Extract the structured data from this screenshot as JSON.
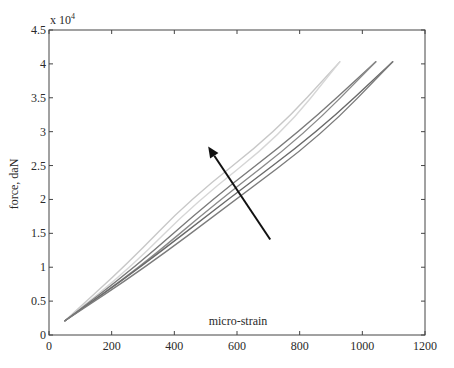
{
  "chart_data": {
    "type": "line",
    "title": "",
    "xlabel": "micro-strain",
    "ylabel": "force, daN",
    "y_multiplier_label": "x 10",
    "y_multiplier_exponent": "4",
    "xlim": [
      0,
      1200
    ],
    "ylim": [
      0,
      4.5
    ],
    "x_ticks": [
      0,
      200,
      400,
      600,
      800,
      1000,
      1200
    ],
    "y_ticks": [
      0,
      0.5,
      1,
      1.5,
      2,
      2.5,
      3,
      3.5,
      4,
      4.5
    ],
    "x_tick_labels": [
      "0",
      "200",
      "400",
      "600",
      "800",
      "1000",
      "1200"
    ],
    "y_tick_labels": [
      "0",
      "0.5",
      "1",
      "1.5",
      "2",
      "2.5",
      "3",
      "3.5",
      "4",
      "4.5"
    ],
    "grid": false,
    "legend": null,
    "series": [
      {
        "name": "cycle-1-loading",
        "color": "#c8c8c8",
        "x": [
          51,
          250,
          450,
          724,
          928
        ],
        "y": [
          0.21,
          1.05,
          2.0,
          3.0,
          4.03
        ]
      },
      {
        "name": "cycle-1-unloading",
        "color": "#d6d6d6",
        "x": [
          51,
          262,
          466,
          740,
          928
        ],
        "y": [
          0.21,
          1.0,
          1.95,
          2.95,
          4.03
        ]
      },
      {
        "name": "cycle-2-loading",
        "color": "#7a7a7a",
        "x": [
          51,
          275,
          520,
          800,
          1043
        ],
        "y": [
          0.21,
          1.0,
          2.0,
          3.0,
          4.03
        ]
      },
      {
        "name": "cycle-2-unloading",
        "color": "#8a8a8a",
        "x": [
          51,
          285,
          536,
          815,
          1043
        ],
        "y": [
          0.21,
          0.98,
          1.96,
          2.96,
          4.03
        ]
      },
      {
        "name": "cycle-3-loading",
        "color": "#6a6a6a",
        "x": [
          51,
          292,
          571,
          858,
          1097
        ],
        "y": [
          0.21,
          1.0,
          2.0,
          3.0,
          4.03
        ]
      },
      {
        "name": "cycle-3-unloading",
        "color": "#7c7c7c",
        "x": [
          51,
          302,
          586,
          872,
          1097
        ],
        "y": [
          0.21,
          0.98,
          1.96,
          2.96,
          4.03
        ]
      }
    ],
    "annotations": [
      {
        "type": "arrow",
        "from": [
          706,
          1.41
        ],
        "to": [
          508,
          2.78
        ],
        "color": "#111111",
        "meaning": "direction of stiffening across cycles"
      }
    ]
  }
}
